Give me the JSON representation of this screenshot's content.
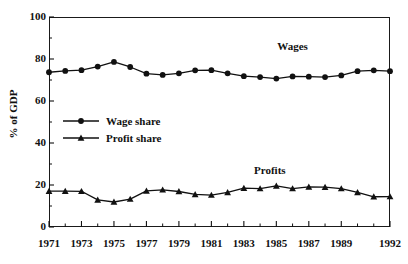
{
  "chart_data": {
    "type": "line",
    "title": "",
    "xlabel": "",
    "ylabel": "% of GDP",
    "xlim": [
      1971,
      1992
    ],
    "ylim": [
      0,
      100
    ],
    "grid": false,
    "legend_position": "inside-left",
    "x": [
      1971,
      1972,
      1973,
      1974,
      1975,
      1976,
      1977,
      1978,
      1979,
      1980,
      1981,
      1982,
      1983,
      1984,
      1985,
      1986,
      1987,
      1988,
      1989,
      1990,
      1991,
      1992
    ],
    "xtick_labels": [
      "1971",
      "1973",
      "1975",
      "1977",
      "1979",
      "1981",
      "1983",
      "1985",
      "1987",
      "1989",
      "1992"
    ],
    "xtick_values": [
      1971,
      1973,
      1975,
      1977,
      1979,
      1981,
      1983,
      1985,
      1987,
      1989,
      1992
    ],
    "ytick_labels": [
      "0",
      "20",
      "40",
      "60",
      "80",
      "100"
    ],
    "ytick_values": [
      0,
      20,
      40,
      60,
      80,
      100
    ],
    "series": [
      {
        "name": "Wage share",
        "annotation": "Wages",
        "annotation_x": 1986,
        "annotation_y": 86,
        "marker": "circle",
        "color": "#111111",
        "values": [
          73.7,
          74.3,
          74.7,
          76.4,
          78.6,
          76.2,
          73.0,
          72.4,
          73.2,
          74.6,
          74.7,
          73.2,
          71.8,
          71.4,
          70.7,
          71.7,
          71.6,
          71.4,
          72.2,
          74.2,
          74.6,
          74.2
        ]
      },
      {
        "name": "Profit share",
        "annotation": "Profits",
        "annotation_x": 1984.6,
        "annotation_y": 27,
        "marker": "triangle",
        "color": "#111111",
        "values": [
          17.1,
          17.1,
          17.0,
          12.9,
          11.9,
          13.3,
          17.2,
          17.7,
          16.9,
          15.5,
          15.2,
          16.5,
          18.5,
          18.3,
          19.6,
          18.3,
          19.1,
          19.0,
          18.3,
          16.5,
          14.4,
          14.5
        ]
      }
    ]
  },
  "legend": {
    "items": [
      {
        "label": "Wage share",
        "marker": "circle"
      },
      {
        "label": "Profit share",
        "marker": "triangle"
      }
    ]
  }
}
